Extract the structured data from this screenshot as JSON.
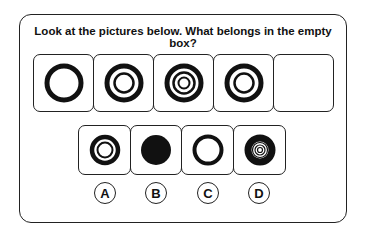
{
  "question": "Look at the pictures below. What belongs in the empty box?",
  "sequence": [
    {
      "id": "seq-1",
      "figure": "single-thick-ring"
    },
    {
      "id": "seq-2",
      "figure": "thick-ring-with-inner-ring"
    },
    {
      "id": "seq-3",
      "figure": "thick-ring-with-two-inner-rings"
    },
    {
      "id": "seq-4",
      "figure": "thick-ring-with-inner-ring"
    },
    {
      "id": "seq-5",
      "figure": "empty"
    }
  ],
  "options": [
    {
      "label": "A",
      "figure": "thick-ring-with-thin-inner-ring"
    },
    {
      "label": "B",
      "figure": "filled-circle"
    },
    {
      "label": "C",
      "figure": "single-thick-ring"
    },
    {
      "label": "D",
      "figure": "thick-ring-with-three-inner-rings"
    }
  ],
  "colors": {
    "stroke": "#111111",
    "background": "#ffffff"
  }
}
